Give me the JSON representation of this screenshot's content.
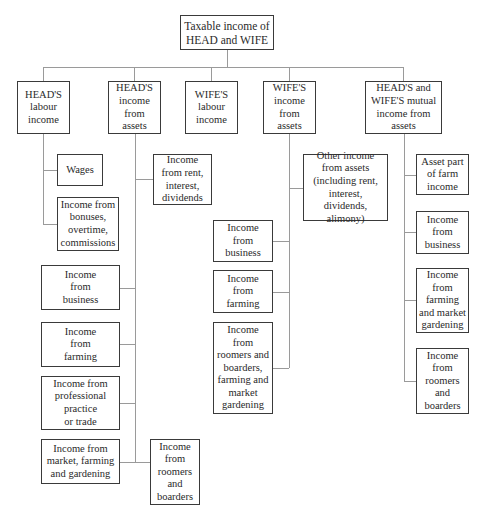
{
  "root": {
    "label": "Taxable income of\nHEAD and WIFE"
  },
  "categories": [
    {
      "label": "HEAD'S\nlabour\nincome",
      "children": [
        {
          "label": "Wages"
        },
        {
          "label": "Income from\nbonuses,\novertime,\ncommissions"
        }
      ]
    },
    {
      "label": "HEAD'S\nincome\nfrom\nassets",
      "children": [
        {
          "label": "Income\nfrom rent,\ninterest,\ndividends"
        },
        {
          "label": "Income\nfrom\nbusiness"
        },
        {
          "label": "Income\nfrom\nfarming"
        },
        {
          "label": "Income from\nprofessional\npractice\nor trade"
        },
        {
          "label": "Income from\nmarket, farming\nand gardening"
        },
        {
          "label": "Income\nfrom\nroomers\nand\nboarders"
        }
      ]
    },
    {
      "label": "WIFE'S\nlabour\nincome",
      "children": []
    },
    {
      "label": "WIFE'S\nincome\nfrom\nassets",
      "children": [
        {
          "label": "Other income\nfrom assets\n(including rent,\ninterest, dividends,\nalimony)"
        },
        {
          "label": "Income\nfrom\nbusiness"
        },
        {
          "label": "Income\nfrom\nfarming"
        },
        {
          "label": "Income\nfrom\nroomers and\nboarders,\nfarming and\nmarket\ngardening"
        }
      ]
    },
    {
      "label": "HEAD'S and\nWIFE'S mutual\nincome from\nassets",
      "children": [
        {
          "label": "Asset part\nof farm\nincome"
        },
        {
          "label": "Income\nfrom\nbusiness"
        },
        {
          "label": "Income\nfrom\nfarming\nand market\ngardening"
        },
        {
          "label": "Income\nfrom\nroomers\nand\nboarders"
        }
      ]
    }
  ]
}
